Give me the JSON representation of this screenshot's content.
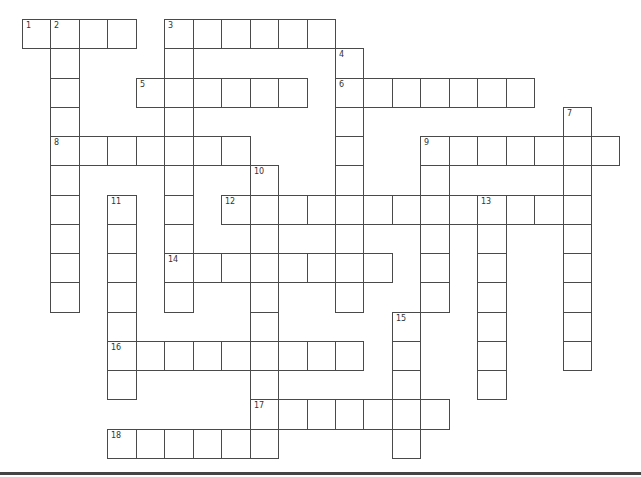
{
  "puzzle": {
    "type": "crossword",
    "grid": {
      "origin_x": 22,
      "origin_y": 19,
      "cell_w": 28.45,
      "cell_h": 29.25,
      "columns": 21,
      "rows": 15
    },
    "words": [
      {
        "number": "1",
        "direction": "across",
        "row": 0,
        "col": 0,
        "length": 4
      },
      {
        "number": "2",
        "direction": "down",
        "row": 0,
        "col": 1,
        "length": 10
      },
      {
        "number": "3",
        "direction": "across",
        "row": 0,
        "col": 5,
        "length": 6
      },
      {
        "number": "3",
        "direction": "down",
        "row": 0,
        "col": 5,
        "length": 10
      },
      {
        "number": "4",
        "direction": "down",
        "row": 1,
        "col": 11,
        "length": 9
      },
      {
        "number": "5",
        "direction": "across",
        "row": 2,
        "col": 4,
        "length": 6
      },
      {
        "number": "6",
        "direction": "across",
        "row": 2,
        "col": 11,
        "length": 7
      },
      {
        "number": "7",
        "direction": "down",
        "row": 3,
        "col": 19,
        "length": 9
      },
      {
        "number": "8",
        "direction": "across",
        "row": 4,
        "col": 1,
        "length": 7
      },
      {
        "number": "9",
        "direction": "across",
        "row": 4,
        "col": 14,
        "length": 7
      },
      {
        "number": "9",
        "direction": "down",
        "row": 4,
        "col": 14,
        "length": 6
      },
      {
        "number": "10",
        "direction": "down",
        "row": 5,
        "col": 8,
        "length": 10
      },
      {
        "number": "11",
        "direction": "down",
        "row": 6,
        "col": 3,
        "length": 7
      },
      {
        "number": "12",
        "direction": "across",
        "row": 6,
        "col": 7,
        "length": 13
      },
      {
        "number": "13",
        "direction": "down",
        "row": 6,
        "col": 16,
        "length": 7
      },
      {
        "number": "14",
        "direction": "across",
        "row": 8,
        "col": 5,
        "length": 8
      },
      {
        "number": "15",
        "direction": "down",
        "row": 10,
        "col": 13,
        "length": 5
      },
      {
        "number": "16",
        "direction": "across",
        "row": 11,
        "col": 3,
        "length": 9
      },
      {
        "number": "17",
        "direction": "across",
        "row": 13,
        "col": 8,
        "length": 7
      },
      {
        "number": "18",
        "direction": "across",
        "row": 14,
        "col": 3,
        "length": 6
      }
    ],
    "colors": {
      "border": "#4a4a4a",
      "number": "#333333",
      "background": "#ffffff",
      "rule": "#444444"
    }
  }
}
